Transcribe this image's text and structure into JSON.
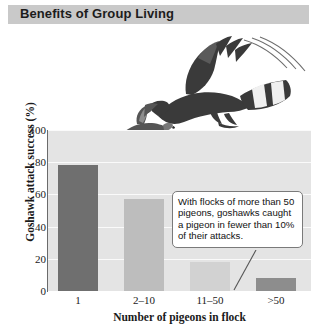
{
  "banner": {
    "title": "Benefits of Group Living"
  },
  "chart_data": {
    "type": "bar",
    "title": "",
    "categories": [
      "1",
      "2–10",
      "11–50",
      ">50"
    ],
    "values": [
      78,
      57,
      18,
      8
    ],
    "series": [
      {
        "name": "Goshawk attack success",
        "values": [
          78,
          57,
          18,
          8
        ]
      }
    ],
    "xlabel": "Number of pigeons in flock",
    "ylabel": "Goshawk attack success (%)",
    "ylim": [
      0,
      100
    ],
    "yticks": [
      0,
      20,
      40,
      60,
      80,
      100
    ],
    "ytick_labels": [
      "0",
      "20",
      "40",
      "60",
      "80",
      "100"
    ],
    "grid": true,
    "legend": "none",
    "bar_colors": [
      "#6f6f6f",
      "#bdbdbd",
      "#d2d2d2",
      "#8d8d8d"
    ],
    "plot_background": "#e4e4e4",
    "annotations": [
      {
        "text": "With flocks of more than 50 pigeons, goshawks caught a pigeon in fewer than 10% of their attacks.",
        "points_to_category": ">50"
      }
    ]
  },
  "illustrations": [
    {
      "name": "goshawk-illustration",
      "label": "Goshawk in flight"
    },
    {
      "name": "pigeon-illustration",
      "label": "Pigeon in flight"
    }
  ],
  "colors": {
    "banner_background": "#c9c9c9",
    "plot_background": "#e4e4e4",
    "gridline": "#fafafa",
    "axis": "#6b6b6b",
    "text": "#1a1a1a"
  }
}
